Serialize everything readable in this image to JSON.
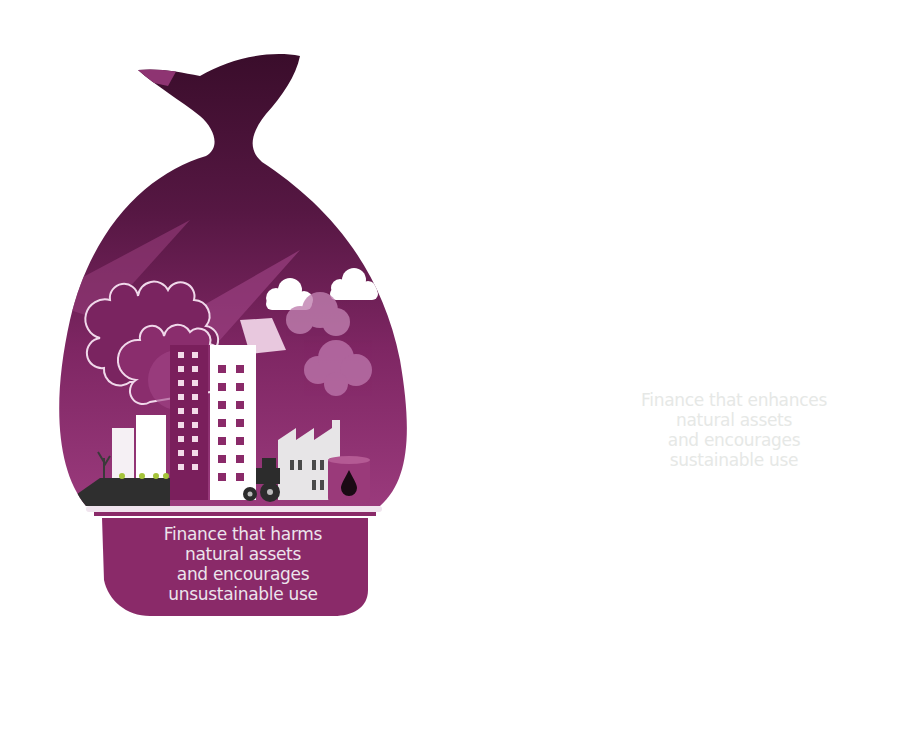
{
  "figure": {
    "type": "balance-scale-infographic",
    "left_pan": {
      "theme": "harmful-finance",
      "lines": [
        "Finance that harms",
        "natural assets",
        "and encourages",
        "unsustainable use"
      ],
      "color": "#8a2a69",
      "bag_color_top": "#3c0f2c",
      "bag_color_bottom": "#9a3a7a",
      "position": "low",
      "illustration": [
        "gears",
        "office-buildings",
        "factory",
        "smoke-clouds",
        "tractor",
        "oil-barrel",
        "farmland",
        "dead-tree"
      ]
    },
    "right_pan": {
      "theme": "sustainable-finance",
      "lines": [
        "Finance that enhances",
        "natural assets",
        "and encourages",
        "sustainable use"
      ],
      "color": "#2e3233",
      "bag_color": "#dbe6a4",
      "position": "high",
      "illustration": [
        "tropical-trees",
        "birds",
        "ferns",
        "planter-box",
        "water",
        "mushroom"
      ]
    },
    "fulcrum": {
      "color": "#8fdcef"
    },
    "colors": {
      "background": "#ffffff",
      "magenta": "#8a2a69",
      "dark": "#2e3233",
      "lime": "#a8c93a",
      "light-lime": "#dbe6a4",
      "cyan": "#8fdcef",
      "pivot": "#d9d6dc"
    }
  }
}
